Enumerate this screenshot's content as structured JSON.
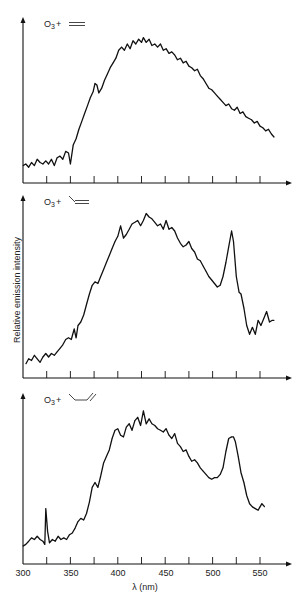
{
  "chart_data": [
    {
      "type": "line",
      "title": "O3 + ethylene",
      "label_text": "O",
      "label_sub": "3",
      "label_plus": "+",
      "molecule": "ethylene",
      "xlabel": "λ (nm)",
      "ylabel": "Relative emission intensity",
      "xlim": [
        300,
        575
      ],
      "ylim": [
        0,
        100
      ],
      "xticks": [
        325,
        350,
        375,
        400,
        425,
        450,
        475,
        500,
        525,
        550
      ],
      "grid": false,
      "series": [
        {
          "name": "O3 + ethylene",
          "x": [
            300,
            303,
            306,
            309,
            312,
            315,
            318,
            321,
            324,
            327,
            330,
            333,
            336,
            339,
            342,
            345,
            348,
            350,
            353,
            356,
            359,
            362,
            365,
            368,
            371,
            374,
            376,
            378,
            380,
            383,
            386,
            389,
            392,
            395,
            398,
            401,
            404,
            407,
            410,
            413,
            416,
            419,
            422,
            425,
            427,
            430,
            433,
            436,
            439,
            442,
            445,
            448,
            451,
            454,
            457,
            460,
            463,
            466,
            469,
            472,
            475,
            478,
            481,
            484,
            487,
            490,
            493,
            496,
            499,
            502,
            505,
            508,
            511,
            514,
            517,
            520,
            523,
            526,
            529,
            532,
            535,
            538,
            541,
            544,
            547,
            550,
            553,
            556,
            559,
            562,
            565
          ],
          "values": [
            11,
            12,
            10,
            13,
            11,
            15,
            13,
            12,
            14,
            12,
            15,
            11,
            16,
            17,
            15,
            20,
            19,
            12,
            24,
            28,
            34,
            39,
            44,
            49,
            54,
            58,
            63,
            62,
            57,
            60,
            65,
            69,
            73,
            76,
            79,
            84,
            86,
            84,
            88,
            85,
            90,
            88,
            91,
            89,
            92,
            89,
            91,
            87,
            88,
            86,
            88,
            84,
            85,
            82,
            83,
            81,
            78,
            79,
            76,
            77,
            74,
            73,
            71,
            72,
            68,
            66,
            63,
            60,
            59,
            57,
            55,
            53,
            51,
            49,
            50,
            47,
            46,
            48,
            44,
            45,
            42,
            41,
            40,
            38,
            39,
            36,
            35,
            33,
            34,
            31,
            29
          ]
        }
      ]
    },
    {
      "type": "line",
      "title": "O3 + propylene",
      "label_text": "O",
      "label_sub": "3",
      "label_plus": "+",
      "molecule": "propylene",
      "xlabel": "λ (nm)",
      "ylabel": "Relative emission intensity",
      "xlim": [
        300,
        575
      ],
      "ylim": [
        0,
        100
      ],
      "xticks": [
        325,
        350,
        375,
        400,
        425,
        450,
        475,
        500,
        525,
        550
      ],
      "grid": false,
      "series": [
        {
          "name": "O3 + propylene",
          "x": [
            303,
            306,
            309,
            312,
            315,
            318,
            321,
            324,
            327,
            330,
            333,
            336,
            339,
            342,
            345,
            348,
            351,
            354,
            356,
            358,
            361,
            364,
            367,
            370,
            373,
            376,
            379,
            382,
            385,
            388,
            391,
            394,
            397,
            400,
            403,
            406,
            409,
            412,
            415,
            418,
            421,
            424,
            427,
            430,
            433,
            436,
            439,
            442,
            445,
            448,
            451,
            454,
            457,
            460,
            463,
            466,
            469,
            472,
            475,
            478,
            481,
            484,
            487,
            490,
            493,
            496,
            499,
            502,
            505,
            508,
            511,
            514,
            517,
            520,
            522,
            525,
            528,
            530,
            533,
            536,
            539,
            542,
            545,
            548,
            551,
            554,
            557,
            560,
            563,
            565
          ],
          "values": [
            8,
            11,
            10,
            13,
            11,
            9,
            12,
            14,
            12,
            14,
            13,
            15,
            17,
            19,
            22,
            23,
            22,
            28,
            23,
            30,
            32,
            36,
            42,
            48,
            53,
            55,
            54,
            58,
            62,
            66,
            70,
            74,
            78,
            81,
            87,
            80,
            82,
            85,
            88,
            89,
            90,
            87,
            90,
            94,
            92,
            91,
            89,
            87,
            88,
            85,
            90,
            85,
            86,
            84,
            80,
            77,
            75,
            76,
            78,
            74,
            72,
            68,
            67,
            64,
            61,
            58,
            56,
            54,
            52,
            53,
            58,
            66,
            75,
            84,
            78,
            58,
            49,
            48,
            40,
            30,
            25,
            29,
            25,
            33,
            30,
            34,
            38,
            32,
            33,
            33
          ]
        }
      ]
    },
    {
      "type": "line",
      "title": "O3 + 1-butene",
      "label_text": "O",
      "label_sub": "3",
      "label_plus": "+",
      "molecule": "1-butene",
      "xlabel": "λ (nm)",
      "ylabel": "Relative emission intensity",
      "xlim": [
        300,
        575
      ],
      "ylim": [
        0,
        100
      ],
      "xticks": [
        325,
        350,
        375,
        400,
        425,
        450,
        475,
        500,
        525,
        550
      ],
      "grid": false,
      "series": [
        {
          "name": "O3 + 1-butene",
          "x": [
            300,
            303,
            306,
            309,
            312,
            315,
            318,
            321,
            323,
            324,
            326,
            328,
            331,
            334,
            337,
            340,
            343,
            346,
            349,
            352,
            355,
            358,
            361,
            364,
            367,
            370,
            373,
            376,
            379,
            382,
            385,
            388,
            391,
            394,
            397,
            400,
            403,
            406,
            409,
            412,
            415,
            418,
            421,
            424,
            427,
            430,
            433,
            436,
            439,
            442,
            445,
            448,
            451,
            454,
            457,
            460,
            463,
            466,
            469,
            472,
            475,
            478,
            481,
            484,
            487,
            490,
            493,
            496,
            499,
            502,
            505,
            508,
            511,
            514,
            517,
            520,
            522,
            524,
            527,
            530,
            533,
            536,
            539,
            542,
            545,
            548,
            550,
            552,
            555
          ],
          "values": [
            11,
            12,
            14,
            16,
            15,
            17,
            15,
            14,
            12,
            34,
            20,
            13,
            15,
            14,
            17,
            15,
            16,
            15,
            18,
            19,
            22,
            26,
            28,
            27,
            31,
            38,
            47,
            50,
            47,
            54,
            62,
            66,
            70,
            77,
            82,
            83,
            79,
            78,
            84,
            86,
            82,
            88,
            90,
            85,
            94,
            86,
            89,
            86,
            85,
            83,
            82,
            81,
            83,
            79,
            77,
            80,
            74,
            72,
            69,
            70,
            66,
            63,
            64,
            62,
            59,
            57,
            55,
            53,
            52,
            53,
            53,
            55,
            59,
            69,
            77,
            78,
            78,
            75,
            66,
            56,
            50,
            42,
            37,
            35,
            34,
            33,
            35,
            37,
            35
          ]
        }
      ]
    }
  ],
  "axis_labels": {
    "xlabel": "λ (nm)",
    "ylabel": "Relative emission intensity",
    "xtick_labels": [
      "300",
      "350",
      "400",
      "450",
      "500",
      "550"
    ]
  }
}
